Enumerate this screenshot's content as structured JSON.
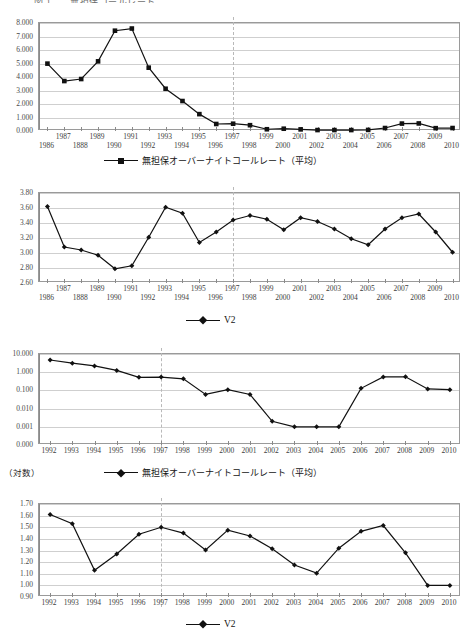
{
  "figure": {
    "title_fragment": "図 1　　無担保コールレート"
  },
  "notes": {
    "log_label": "（対数）"
  },
  "chart_data": [
    {
      "id": "chart1",
      "type": "line",
      "title": "",
      "xlabel": "",
      "ylabel": "",
      "ylim": [
        0.0,
        8.0
      ],
      "yticks": [
        "0.000",
        "1.000",
        "2.000",
        "3.000",
        "4.000",
        "5.000",
        "6.000",
        "7.000",
        "8.000"
      ],
      "ytick_values": [
        0,
        1,
        2,
        3,
        4,
        5,
        6,
        7,
        8
      ],
      "grid": true,
      "marker": "square",
      "legend_position": "bottom",
      "legend": [
        "無担保オーバーナイトコールレート（平均）"
      ],
      "reference_line_x": "1997",
      "categories": [
        "1986",
        "1987",
        "1888",
        "1989",
        "1990",
        "1991",
        "1992",
        "1993",
        "1994",
        "1995",
        "1996",
        "1997",
        "1998",
        "1999",
        "2000",
        "2001",
        "2002",
        "2003",
        "2004",
        "2005",
        "2006",
        "2007",
        "2008",
        "2009",
        "2010"
      ],
      "xtick_rows": [
        [
          "",
          "1987",
          "",
          "1989",
          "",
          "1991",
          "",
          "1993",
          "",
          "1995",
          "",
          "1997",
          "",
          "1999",
          "",
          "2001",
          "",
          "2003",
          "",
          "2005",
          "",
          "2007",
          "",
          "2009",
          ""
        ],
        [
          "1986",
          "",
          "1888",
          "",
          "1990",
          "",
          "1992",
          "",
          "1994",
          "",
          "1996",
          "",
          "1998",
          "",
          "2000",
          "",
          "2002",
          "",
          "2004",
          "",
          "2006",
          "",
          "2008",
          "",
          "2010"
        ]
      ],
      "series": [
        {
          "name": "無担保オーバーナイトコールレート（平均）",
          "values": [
            4.99,
            3.7,
            3.85,
            5.16,
            7.43,
            7.59,
            4.69,
            3.13,
            2.22,
            1.25,
            0.52,
            0.54,
            0.43,
            0.13,
            0.17,
            0.12,
            0.07,
            0.07,
            0.07,
            0.08,
            0.22,
            0.55,
            0.56,
            0.21,
            0.22
          ]
        }
      ]
    },
    {
      "id": "chart2",
      "type": "line",
      "title": "",
      "xlabel": "",
      "ylabel": "",
      "ylim": [
        2.6,
        3.8
      ],
      "yticks": [
        "2.60",
        "2.80",
        "3.00",
        "3.20",
        "3.40",
        "3.60",
        "3.80"
      ],
      "ytick_values": [
        2.6,
        2.8,
        3.0,
        3.2,
        3.4,
        3.6,
        3.8
      ],
      "grid": true,
      "marker": "diamond",
      "legend_position": "bottom",
      "legend": [
        "V2"
      ],
      "reference_line_x": "1997",
      "categories": [
        "1986",
        "1987",
        "1888",
        "1989",
        "1990",
        "1991",
        "1992",
        "1993",
        "1994",
        "1995",
        "1996",
        "1997",
        "1998",
        "1999",
        "2000",
        "2001",
        "2002",
        "2003",
        "2004",
        "2005",
        "2006",
        "2007",
        "2008",
        "2009",
        "2010"
      ],
      "xtick_rows": [
        [
          "",
          "1987",
          "",
          "1989",
          "",
          "1991",
          "",
          "1993",
          "",
          "1995",
          "",
          "1997",
          "",
          "1999",
          "",
          "2001",
          "",
          "2003",
          "",
          "2005",
          "",
          "2007",
          "",
          "2009",
          ""
        ],
        [
          "1986",
          "",
          "1888",
          "",
          "1990",
          "",
          "1992",
          "",
          "1994",
          "",
          "1996",
          "",
          "1998",
          "",
          "2000",
          "",
          "2002",
          "",
          "2004",
          "",
          "2006",
          "",
          "2008",
          "",
          "2010"
        ]
      ],
      "series": [
        {
          "name": "V2",
          "values": [
            3.62,
            3.08,
            3.04,
            2.97,
            2.79,
            2.83,
            3.21,
            3.61,
            3.53,
            3.14,
            3.28,
            3.44,
            3.5,
            3.45,
            3.31,
            3.47,
            3.42,
            3.32,
            3.19,
            3.11,
            3.32,
            3.47,
            3.52,
            3.28,
            3.01,
            3.01
          ]
        }
      ]
    },
    {
      "id": "chart3",
      "type": "line",
      "title": "",
      "xlabel": "",
      "ylabel": "（対数）",
      "yscale": "log",
      "ylim": [
        0.0001,
        10.0
      ],
      "yticks": [
        "0.000",
        "0.001",
        "0.010",
        "0.100",
        "1.000",
        "10.000"
      ],
      "ytick_values": [
        0.0001,
        0.001,
        0.01,
        0.1,
        1.0,
        10.0
      ],
      "grid": true,
      "marker": "diamond",
      "legend_position": "bottom",
      "legend": [
        "無担保オーバーナイトコールレート（平均）"
      ],
      "reference_line_x": "1997",
      "categories": [
        "1992",
        "1993",
        "1994",
        "1995",
        "1996",
        "1997",
        "1998",
        "1999",
        "2000",
        "2001",
        "2002",
        "2003",
        "2004",
        "2005",
        "2006",
        "2007",
        "2008",
        "2009",
        "2010"
      ],
      "xtick_rows": [
        [
          "1992",
          "1993",
          "1994",
          "1995",
          "1996",
          "1997",
          "1998",
          "1999",
          "2000",
          "2001",
          "2002",
          "2003",
          "2004",
          "2005",
          "2006",
          "2007",
          "2008",
          "2009",
          "2010"
        ]
      ],
      "series": [
        {
          "name": "無担保オーバーナイトコールレート（平均）",
          "values": [
            4.69,
            3.13,
            2.22,
            1.25,
            0.52,
            0.54,
            0.43,
            0.06,
            0.11,
            0.06,
            0.002,
            0.001,
            0.001,
            0.001,
            0.13,
            0.55,
            0.56,
            0.12,
            0.11
          ]
        }
      ]
    },
    {
      "id": "chart4",
      "type": "line",
      "title": "",
      "xlabel": "",
      "ylabel": "",
      "ylim": [
        0.9,
        1.7
      ],
      "yticks": [
        "0.90",
        "1.00",
        "1.10",
        "1.20",
        "1.30",
        "1.40",
        "1.50",
        "1.60",
        "1.70"
      ],
      "ytick_values": [
        0.9,
        1.0,
        1.1,
        1.2,
        1.3,
        1.4,
        1.5,
        1.6,
        1.7
      ],
      "grid": true,
      "marker": "diamond",
      "legend_position": "bottom",
      "legend": [
        "V2"
      ],
      "reference_line_x": "1997",
      "categories": [
        "1992",
        "1993",
        "1994",
        "1995",
        "1996",
        "1997",
        "1998",
        "1999",
        "2000",
        "2001",
        "2002",
        "2003",
        "2004",
        "2005",
        "2006",
        "2007",
        "2008",
        "2009",
        "2010"
      ],
      "xtick_rows": [
        [
          "1992",
          "1993",
          "1994",
          "1995",
          "1996",
          "1997",
          "1998",
          "1999",
          "2000",
          "2001",
          "2002",
          "2003",
          "2004",
          "2005",
          "2006",
          "2007",
          "2008",
          "2009",
          "2010"
        ]
      ],
      "series": [
        {
          "name": "V2",
          "values": [
            1.61,
            1.53,
            1.13,
            1.27,
            1.44,
            1.5,
            1.45,
            1.305,
            1.475,
            1.425,
            1.315,
            1.175,
            1.105,
            1.32,
            1.465,
            1.515,
            1.28,
            1.0,
            1.0
          ]
        }
      ]
    }
  ]
}
